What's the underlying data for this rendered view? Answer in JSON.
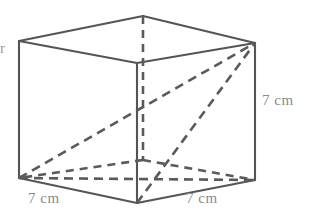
{
  "figure": {
    "shape_name": "cube",
    "projection": "oblique",
    "solid_stroke_color": "#555555",
    "dashed_stroke_color": "#5a5a5a",
    "label_color": "#8a8a8a",
    "background_color": "#ffffff",
    "clipped_edge_glyph": "r"
  },
  "labels": {
    "bottom_left": "7 cm",
    "bottom_right": "7 cm",
    "right_side": "7 cm"
  },
  "chart_data": {
    "type": "diagram",
    "units": "cm",
    "edge_length": 7,
    "vertices": {
      "front_top_left": [
        19,
        41
      ],
      "front_top_right": [
        137,
        63
      ],
      "back_top_left": [
        143,
        16
      ],
      "back_top_right": [
        255,
        43
      ],
      "front_bottom_left": [
        19,
        178
      ],
      "front_bottom_right": [
        137,
        203
      ],
      "back_bottom_left": [
        143,
        160
      ],
      "back_bottom_right": [
        255,
        180
      ]
    },
    "solid_edges": [
      [
        "front_top_left",
        "back_top_left"
      ],
      [
        "back_top_left",
        "back_top_right"
      ],
      [
        "back_top_right",
        "front_top_right"
      ],
      [
        "front_top_right",
        "front_top_left"
      ],
      [
        "front_top_left",
        "front_bottom_left"
      ],
      [
        "front_top_right",
        "front_bottom_right"
      ],
      [
        "back_top_right",
        "back_bottom_right"
      ],
      [
        "front_bottom_left",
        "front_bottom_right"
      ],
      [
        "front_bottom_right",
        "back_bottom_right"
      ]
    ],
    "dashed_edges": [
      [
        "back_top_left",
        "back_bottom_left"
      ],
      [
        "back_bottom_left",
        "back_bottom_right"
      ],
      [
        "back_bottom_left",
        "front_bottom_left"
      ]
    ],
    "dashed_diagonals": [
      [
        "front_bottom_left",
        "back_top_right"
      ],
      [
        "front_bottom_left",
        "back_bottom_right"
      ],
      [
        "front_bottom_right",
        "back_top_right"
      ]
    ],
    "dimension_labels": [
      {
        "text": "7 cm",
        "edge": "front_bottom_left-front_bottom_right",
        "x": 28,
        "y": 190
      },
      {
        "text": "7 cm",
        "edge": "front_bottom_right-back_bottom_right",
        "x": 186,
        "y": 190
      },
      {
        "text": "7 cm",
        "edge": "back_top_right-back_bottom_right",
        "x": 262,
        "y": 92
      }
    ]
  }
}
